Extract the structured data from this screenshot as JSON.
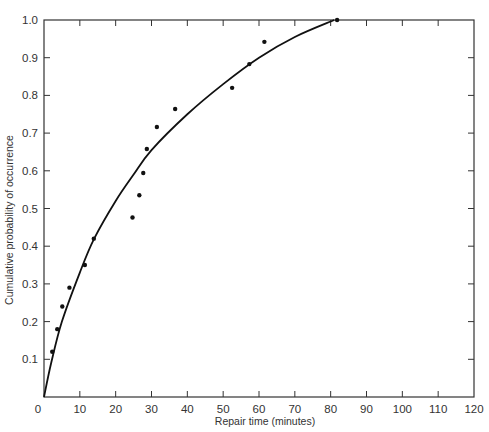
{
  "chart_data": {
    "type": "scatter",
    "title": "",
    "xlabel": "Repair time (minutes)",
    "ylabel": "Cumulative probability of occurrence",
    "xlim": [
      0,
      120
    ],
    "ylim": [
      0,
      1.0
    ],
    "grid": false,
    "legend": null,
    "x_ticks": [
      0,
      10,
      20,
      30,
      40,
      50,
      60,
      70,
      80,
      90,
      100,
      110,
      120
    ],
    "y_ticks": [
      "0.1",
      "0.2",
      "0.3",
      "0.4",
      "0.5",
      "0.6",
      "0.7",
      "0.8",
      "0.9",
      "1.0"
    ],
    "x_tick_labels": [
      "0",
      "10",
      "20",
      "30",
      "40",
      "50",
      "60",
      "70",
      "80",
      "90",
      "100",
      "110",
      "120"
    ],
    "series": [
      {
        "name": "Observed repair times",
        "kind": "scatter",
        "x": [
          2.3,
          3.7,
          5.1,
          7.1,
          11.4,
          13.9,
          24.7,
          26.6,
          27.7,
          28.7,
          31.5,
          36.6,
          52.5,
          57.3,
          61.5,
          81.8
        ],
        "y": [
          0.12,
          0.18,
          0.24,
          0.29,
          0.35,
          0.42,
          0.476,
          0.535,
          0.594,
          0.658,
          0.716,
          0.764,
          0.82,
          0.883,
          0.942,
          1.0
        ]
      },
      {
        "name": "Fitted cumulative distribution",
        "kind": "line",
        "x": [
          0,
          2,
          5,
          10,
          14,
          20,
          25,
          30,
          40,
          50,
          60,
          70,
          81
        ],
        "y": [
          0,
          0.09,
          0.2,
          0.33,
          0.42,
          0.52,
          0.59,
          0.655,
          0.75,
          0.83,
          0.9,
          0.955,
          1.0
        ]
      }
    ]
  }
}
